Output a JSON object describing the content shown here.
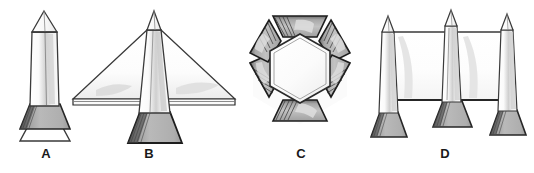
{
  "figure": {
    "title": "",
    "background_color": "#ffffff",
    "outline_color": "#3a3a3a",
    "dark_outline_color": "#1d1d1d",
    "fill_light": "#fdfdfd",
    "fill_mid": "#b5b5b5",
    "fill_shadow": "#8c8c8c",
    "fill_pale": "#e3e3e3",
    "label_color": "#1a1a1a"
  },
  "labels": [
    {
      "id": "a",
      "text": "A"
    },
    {
      "id": "b",
      "text": "B"
    },
    {
      "id": "c",
      "text": "C"
    },
    {
      "id": "d",
      "text": "D"
    }
  ],
  "panels": [
    {
      "key": "a",
      "label": "A",
      "description": "single tapered column with pointed cap on a flared trapezoidal base over an open trapezoid footing"
    },
    {
      "key": "b",
      "label": "B",
      "description": "central column with pointed cap and two large swept triangular wings resting on a flared trapezoidal base"
    },
    {
      "key": "c",
      "label": "C",
      "description": "hexagonal ring assembled from six trapezoidal segments around a hollow hexagonal core"
    },
    {
      "key": "d",
      "label": "D",
      "description": "three pointed-cap columns on flared bases joined by two rectangular wall panels"
    }
  ]
}
